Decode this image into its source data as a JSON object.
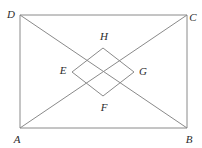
{
  "figure": {
    "type": "geometric-diagram",
    "background_color": "#ffffff",
    "line_color": "#8a8a8a",
    "label_color": "#2b2b2b",
    "stroke_width": 1
  },
  "rectangle": {
    "name": "ABCD",
    "corners": [
      {
        "label": "A",
        "x": 20,
        "y": 128,
        "label_x": 17,
        "label_y": 139
      },
      {
        "label": "B",
        "x": 187,
        "y": 128,
        "label_x": 189,
        "label_y": 139
      },
      {
        "label": "C",
        "x": 187,
        "y": 15,
        "label_x": 193,
        "label_y": 17
      },
      {
        "label": "D",
        "x": 20,
        "y": 15,
        "label_x": 11,
        "label_y": 14
      }
    ]
  },
  "diagonals": [
    {
      "name": "AC",
      "from": "A",
      "to": "C",
      "x1": 20,
      "y1": 128,
      "x2": 187,
      "y2": 15
    },
    {
      "name": "DB",
      "from": "D",
      "to": "B",
      "x1": 20,
      "y1": 15,
      "x2": 187,
      "y2": 128
    }
  ],
  "rhombus": {
    "name": "EFGH",
    "vertices": [
      {
        "label": "E",
        "x": 72,
        "y": 72,
        "label_x": 63,
        "label_y": 70
      },
      {
        "label": "F",
        "x": 103,
        "y": 96,
        "label_x": 104,
        "label_y": 107
      },
      {
        "label": "G",
        "x": 134,
        "y": 72,
        "label_x": 143,
        "label_y": 71
      },
      {
        "label": "H",
        "x": 103,
        "y": 48,
        "label_x": 104,
        "label_y": 36
      }
    ]
  },
  "labels": {
    "A": "A",
    "B": "B",
    "C": "C",
    "D": "D",
    "E": "E",
    "F": "F",
    "G": "G",
    "H": "H"
  }
}
